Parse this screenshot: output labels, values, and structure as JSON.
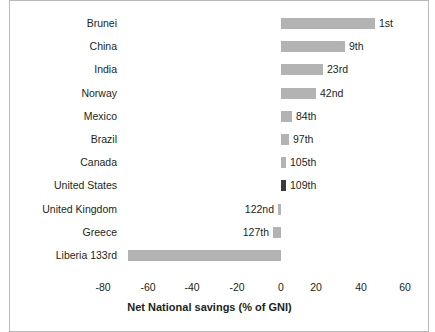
{
  "chart_data": {
    "type": "bar",
    "orientation": "horizontal",
    "title": "",
    "subtitle": "",
    "xlabel": "Net National savings (% of GNI)",
    "ylabel": "",
    "xlim": [
      -90,
      62
    ],
    "xticks": [
      -80,
      -60,
      -40,
      -20,
      0,
      20,
      40,
      60
    ],
    "xtick_labels": [
      "-80",
      "-60",
      "-40",
      "-20",
      "0",
      "20",
      "40",
      "60"
    ],
    "grid": false,
    "legend": "none",
    "categories": [
      "Brunei",
      "China",
      "India",
      "Norway",
      "Mexico",
      "Brazil",
      "Canada",
      "United States",
      "United Kingdom",
      "Greece",
      "Liberia 133rd"
    ],
    "values": [
      42,
      29,
      19,
      16,
      5,
      3.5,
      2,
      2,
      -1.5,
      -3.5,
      -69
    ],
    "annotations": [
      "1st",
      "9th",
      "23rd",
      "42nd",
      "84th",
      "97th",
      "105th",
      "109th",
      "122nd",
      "127th",
      ""
    ],
    "bar_colors": [
      "#b3b3b3",
      "#b3b3b3",
      "#b3b3b3",
      "#b3b3b3",
      "#b3b3b3",
      "#b3b3b3",
      "#b3b3b3",
      "#3a3a3c",
      "#b3b3b3",
      "#b3b3b3",
      "#b3b3b3"
    ],
    "highlight_category": "United States",
    "highlight_color": "#3a3a3c",
    "default_bar_color": "#b3b3b3"
  },
  "rows": [
    {
      "label": "Brunei",
      "rank": "1st",
      "bar_px_left": 281,
      "bar_px_width": 94,
      "rank_px": 379,
      "rank_side": "right",
      "dark": false
    },
    {
      "label": "China",
      "rank": "9th",
      "bar_px_left": 281,
      "bar_px_width": 64,
      "rank_px": 349,
      "rank_side": "right",
      "dark": false
    },
    {
      "label": "India",
      "rank": "23rd",
      "bar_px_left": 281,
      "bar_px_width": 42,
      "rank_px": 327,
      "rank_side": "right",
      "dark": false
    },
    {
      "label": "Norway",
      "rank": "42nd",
      "bar_px_left": 281,
      "bar_px_width": 35,
      "rank_px": 320,
      "rank_side": "right",
      "dark": false
    },
    {
      "label": "Mexico",
      "rank": "84th",
      "bar_px_left": 281,
      "bar_px_width": 11,
      "rank_px": 296,
      "rank_side": "right",
      "dark": false
    },
    {
      "label": "Brazil",
      "rank": "97th",
      "bar_px_left": 281,
      "bar_px_width": 8,
      "rank_px": 293,
      "rank_side": "right",
      "dark": false
    },
    {
      "label": "Canada",
      "rank": "105th",
      "bar_px_left": 281,
      "bar_px_width": 5,
      "rank_px": 290,
      "rank_side": "right",
      "dark": false
    },
    {
      "label": "United States",
      "rank": "109th",
      "bar_px_left": 281,
      "bar_px_width": 5,
      "rank_px": 290,
      "rank_side": "right",
      "dark": true
    },
    {
      "label": "United Kingdom",
      "rank": "122nd",
      "bar_px_left": 278,
      "bar_px_width": 3,
      "rank_px": 274,
      "rank_side": "left",
      "dark": false
    },
    {
      "label": "Greece",
      "rank": "127th",
      "bar_px_left": 273,
      "bar_px_width": 8,
      "rank_px": 269,
      "rank_side": "left",
      "dark": false
    },
    {
      "label": "Liberia 133rd",
      "rank": "",
      "bar_px_left": 128,
      "bar_px_width": 153,
      "rank_px": 0,
      "rank_side": "none",
      "dark": false
    }
  ],
  "ticks": [
    {
      "label": "-80",
      "px": 103
    },
    {
      "label": "-60",
      "px": 148
    },
    {
      "label": "-40",
      "px": 192
    },
    {
      "label": "-20",
      "px": 237
    },
    {
      "label": "0",
      "px": 281
    },
    {
      "label": "20",
      "px": 316
    },
    {
      "label": "40",
      "px": 361
    },
    {
      "label": "60",
      "px": 405
    }
  ],
  "axis": {
    "title": "Net National savings (% of GNI)"
  },
  "colors": {
    "bar": "#b3b3b3",
    "highlight": "#3a3a3c",
    "text": "#231f20",
    "frame": "#b9b9b9",
    "background": "#ffffff"
  }
}
